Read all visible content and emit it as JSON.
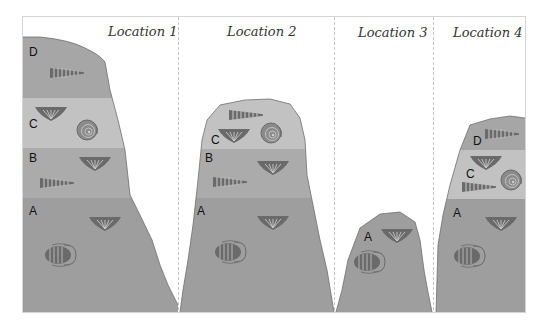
{
  "diagram": {
    "frame_color": "#cfcfcf",
    "divider_style": "dashed",
    "colors": {
      "layer_A": "#9e9e9e",
      "layer_B": "#ababab",
      "layer_C": "#c2c2c2",
      "layer_D": "#a6a6a6",
      "fossil": "#6a6a6a",
      "background": "#ffffff"
    },
    "locations": [
      {
        "name": "Location 1",
        "layers": [
          {
            "label": "D",
            "fossils": [
              "horn-coral"
            ]
          },
          {
            "label": "C",
            "fossils": [
              "brachiopod",
              "ammonite"
            ]
          },
          {
            "label": "B",
            "fossils": [
              "brachiopod",
              "horn-coral"
            ]
          },
          {
            "label": "A",
            "fossils": [
              "brachiopod",
              "trilobite"
            ]
          }
        ]
      },
      {
        "name": "Location 2",
        "layers": [
          {
            "label": "C",
            "fossils": [
              "horn-coral",
              "brachiopod",
              "ammonite"
            ]
          },
          {
            "label": "B",
            "fossils": [
              "brachiopod",
              "horn-coral"
            ]
          },
          {
            "label": "A",
            "fossils": [
              "brachiopod",
              "trilobite"
            ]
          }
        ]
      },
      {
        "name": "Location 3",
        "layers": [
          {
            "label": "A",
            "fossils": [
              "brachiopod",
              "trilobite"
            ]
          }
        ]
      },
      {
        "name": "Location 4",
        "layers": [
          {
            "label": "D",
            "fossils": [
              "horn-coral"
            ]
          },
          {
            "label": "C",
            "fossils": [
              "brachiopod",
              "ammonite",
              "horn-coral"
            ]
          },
          {
            "label": "A",
            "fossils": [
              "brachiopod",
              "trilobite"
            ]
          }
        ]
      }
    ]
  }
}
